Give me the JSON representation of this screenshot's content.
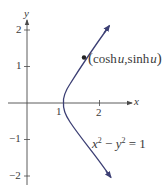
{
  "diagram": {
    "axes": {
      "x_label": "x",
      "y_label": "y",
      "x_ticks": [
        "1",
        "2"
      ],
      "y_ticks": [
        "2",
        "1",
        "−1",
        "−2"
      ]
    },
    "curve": {
      "equation_lhs_x": "x",
      "equation_sup1": "2",
      "equation_minus": " − ",
      "equation_lhs_y": "y",
      "equation_sup2": "2",
      "equation_rhs": " = 1",
      "color": "#3c3f74"
    },
    "point": {
      "open": "(",
      "cosh": "cosh",
      "u1": "u",
      "comma": ",",
      "sinh": "sinh",
      "u2": "u",
      "close": ")"
    },
    "colors": {
      "axis": "#4a4a4a",
      "text": "#3a3a3a",
      "curve": "#3c3f74"
    }
  }
}
